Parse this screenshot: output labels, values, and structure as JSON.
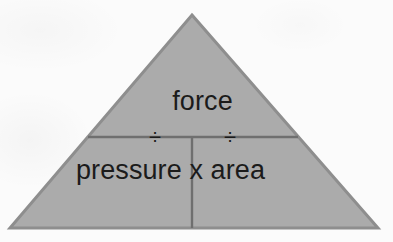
{
  "figure": {
    "kind": "formula-triangle",
    "background_color": "#fbfbfb"
  },
  "triangle": {
    "fill_color": "#ababab",
    "stroke_color": "#8e8e8e",
    "apex": {
      "x": 192,
      "y": 15
    },
    "bottom_left": {
      "x": 10,
      "y": 228
    },
    "bottom_right": {
      "x": 378,
      "y": 228
    }
  },
  "dividers": {
    "horizontal": {
      "y": 137,
      "x_start": 88,
      "x_end": 298,
      "color": "#6f6f6f"
    },
    "vertical": {
      "x": 192,
      "y_start": 137,
      "y_end": 228,
      "color": "#6f6f6f"
    }
  },
  "labels": {
    "numerator": "force",
    "denominator": "pressure x area",
    "divide_left": "÷",
    "divide_right": "÷",
    "text_color": "#1b1b1b"
  }
}
